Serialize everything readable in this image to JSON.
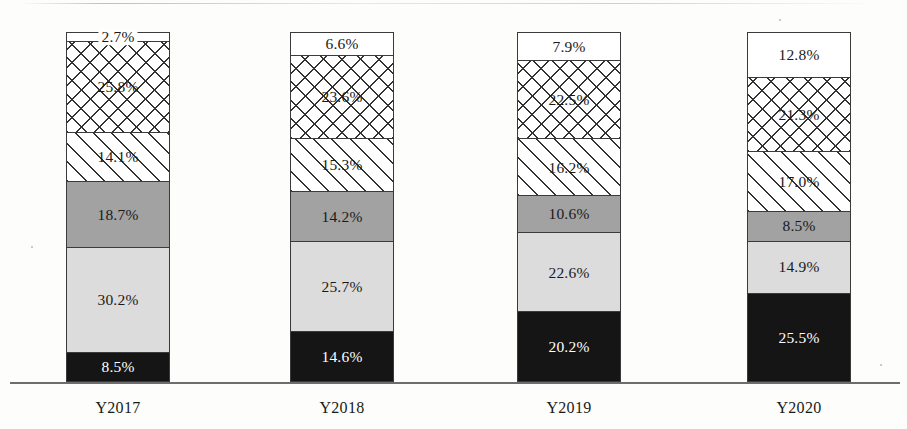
{
  "chart_data": {
    "type": "bar",
    "subtype": "stacked-100-percent",
    "title": "",
    "xlabel": "",
    "ylabel": "",
    "ylim": [
      0,
      100
    ],
    "grid": false,
    "legend": "none",
    "value_suffix": "%",
    "categories": [
      "Y2017",
      "Y2018",
      "Y2019",
      "Y2020"
    ],
    "series": [
      {
        "name": "segment-1-black",
        "fill": "solid-black",
        "color": "#151515",
        "values": [
          8.5,
          14.6,
          20.2,
          25.5
        ]
      },
      {
        "name": "segment-2-light-gray",
        "fill": "solid-light-gray",
        "color": "#dcdcdc",
        "values": [
          30.2,
          25.7,
          22.6,
          14.9
        ]
      },
      {
        "name": "segment-3-mid-gray",
        "fill": "solid-mid-gray",
        "color": "#a2a2a2",
        "values": [
          18.7,
          14.2,
          10.6,
          8.5
        ]
      },
      {
        "name": "segment-4-diagonal",
        "fill": "diagonal-hatch",
        "color": "#ffffff",
        "values": [
          14.1,
          15.3,
          16.2,
          17.0
        ]
      },
      {
        "name": "segment-5-crosshatch",
        "fill": "cross-hatch",
        "color": "#ffffff",
        "values": [
          25.8,
          23.6,
          22.5,
          21.3
        ]
      },
      {
        "name": "segment-6-white",
        "fill": "solid-white",
        "color": "#ffffff",
        "values": [
          2.7,
          6.6,
          7.9,
          12.8
        ]
      }
    ],
    "labels": {
      "Y2017": [
        "8.5%",
        "30.2%",
        "18.7%",
        "14.1%",
        "25.8%",
        "2.7%"
      ],
      "Y2018": [
        "14.6%",
        "25.7%",
        "14.2%",
        "15.3%",
        "23.6%",
        "6.6%"
      ],
      "Y2019": [
        "20.2%",
        "22.6%",
        "10.6%",
        "16.2%",
        "22.5%",
        "7.9%"
      ],
      "Y2020": [
        "25.5%",
        "14.9%",
        "8.5%",
        "17.0%",
        "21.3%",
        "12.8%"
      ]
    }
  },
  "axis": {
    "baseline_color": "#6d6d6d"
  }
}
